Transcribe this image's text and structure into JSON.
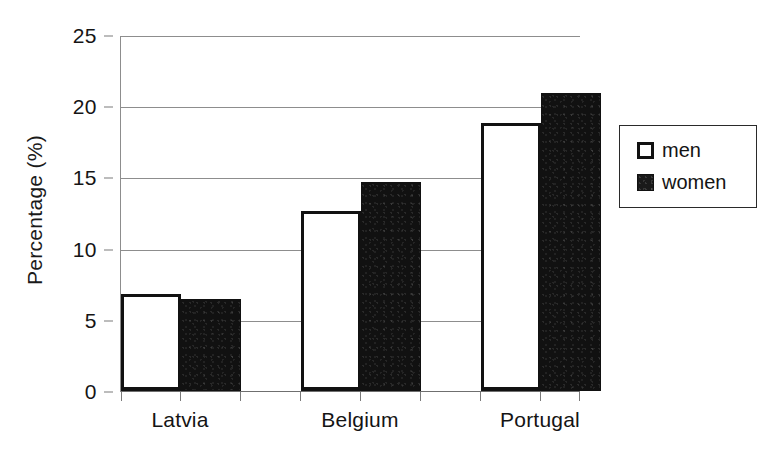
{
  "chart_data": {
    "type": "bar",
    "title": "",
    "subtitle": "",
    "xlabel": "",
    "ylabel": "Percentage (%)",
    "ylim": [
      0,
      25
    ],
    "ytick_values": [
      0,
      5,
      10,
      15,
      20,
      25
    ],
    "ytick_labels": [
      "0",
      "5",
      "10",
      "15",
      "20",
      "25"
    ],
    "categories": [
      "Latvia",
      "Belgium",
      "Portugal"
    ],
    "series": [
      {
        "name": "men",
        "values": [
          6.8,
          12.7,
          18.9
        ],
        "color": "#ffffff",
        "edge_color": "#111111"
      },
      {
        "name": "women",
        "values": [
          6.5,
          14.7,
          21.0
        ],
        "color": "#111111",
        "edge_color": "#111111"
      }
    ],
    "grid": {
      "horizontal": true,
      "vertical": false
    },
    "legend": {
      "position": "right",
      "entries": [
        "men",
        "women"
      ]
    },
    "annotations": []
  },
  "axis": {
    "y_title": "Percentage (%)",
    "y_ticks": [
      "25",
      "20",
      "15",
      "10",
      "5",
      "0"
    ],
    "x_categories": [
      "Latvia",
      "Belgium",
      "Portugal"
    ]
  },
  "legend": {
    "items": [
      {
        "label": "men",
        "swatch": "open-square-icon"
      },
      {
        "label": "women",
        "swatch": "filled-square-icon"
      }
    ]
  }
}
